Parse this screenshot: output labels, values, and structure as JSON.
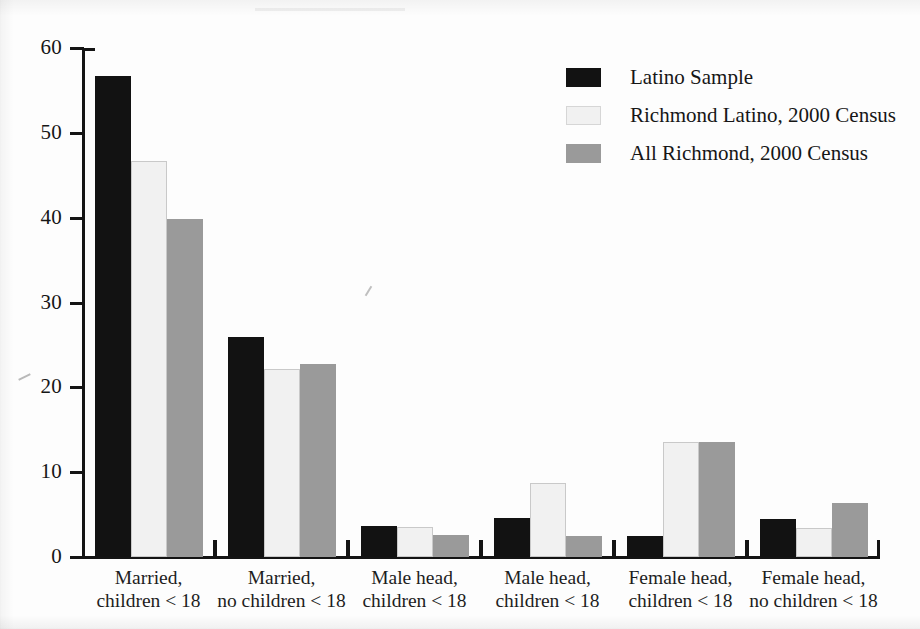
{
  "chart_data": {
    "type": "bar",
    "title": "",
    "xlabel": "",
    "ylabel": "",
    "ylim": [
      0,
      60
    ],
    "ytick_values": [
      0,
      10,
      20,
      30,
      40,
      50,
      60
    ],
    "ytick_labels": [
      "0",
      "10",
      "20",
      "30",
      "40",
      "50",
      "60"
    ],
    "grid": false,
    "legend_position": "top-right",
    "categories": [
      "Married, children < 18",
      "Married, no children < 18",
      "Male head, children < 18",
      "Male head, children < 18",
      "Female head, children < 18",
      "Female head, no children < 18"
    ],
    "category_lines": [
      {
        "line1": "Married,",
        "line2": "children < 18"
      },
      {
        "line1": "Married,",
        "line2": "no children < 18"
      },
      {
        "line1": "Male head,",
        "line2": "children < 18"
      },
      {
        "line1": "Male head,",
        "line2": "children < 18"
      },
      {
        "line1": "Female head,",
        "line2": "children < 18"
      },
      {
        "line1": "Female head,",
        "line2": "no children < 18"
      }
    ],
    "series": [
      {
        "name": "Latino Sample",
        "color": "#121212",
        "values": [
          56.7,
          25.9,
          3.6,
          4.6,
          2.5,
          4.5
        ]
      },
      {
        "name": "Richmond Latino, 2000 Census",
        "color": "#f1f1f1",
        "values": [
          46.7,
          22.2,
          3.5,
          8.7,
          13.5,
          3.4
        ]
      },
      {
        "name": "All Richmond, 2000 Census",
        "color": "#9a9a9a",
        "values": [
          39.8,
          22.8,
          2.6,
          2.5,
          13.6,
          6.4
        ]
      }
    ]
  },
  "legend": {
    "entries": [
      {
        "label": "Latino Sample",
        "swatch": "black-swatch"
      },
      {
        "label": "Richmond Latino, 2000 Census",
        "swatch": "white-swatch"
      },
      {
        "label": "All Richmond, 2000 Census",
        "swatch": "gray-swatch"
      }
    ]
  },
  "axes": {
    "y_max_label": "60",
    "y_min_label": "0"
  },
  "colors": {
    "series_latino_sample": "#121212",
    "series_richmond_latino": "#f1f1f1",
    "series_all_richmond": "#9a9a9a",
    "axis": "#141414",
    "background": "#fdfdfd"
  }
}
